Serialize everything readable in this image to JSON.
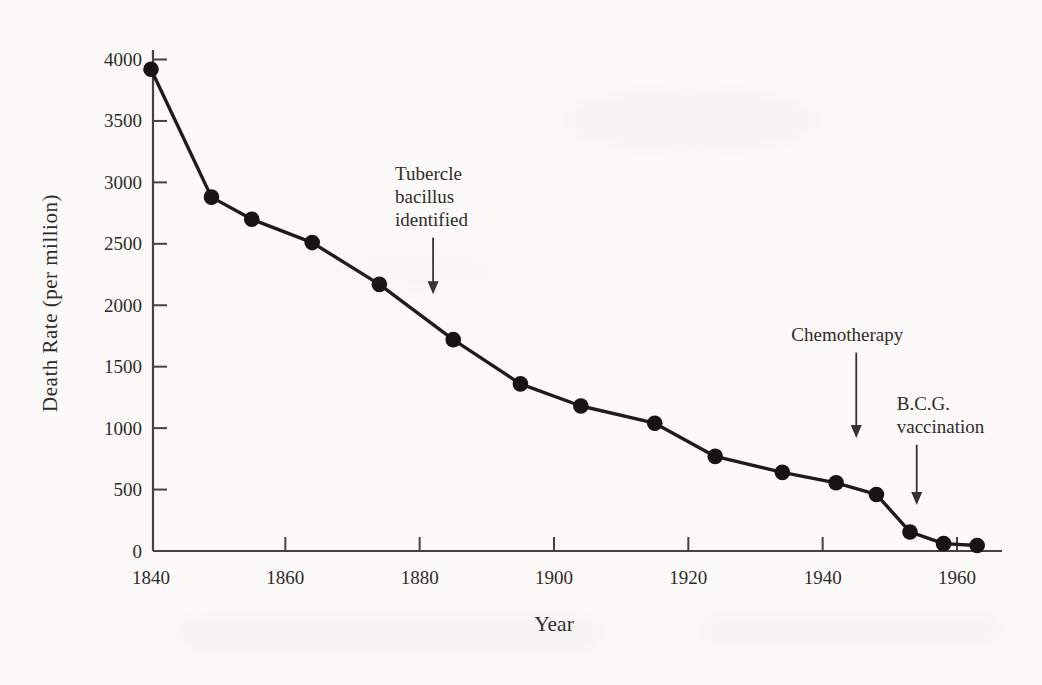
{
  "page": {
    "background": "#fbfaf8"
  },
  "chart_data": {
    "type": "line",
    "title": "",
    "xlabel": "Year",
    "ylabel": "Death Rate (per million)",
    "xlim": [
      1840,
      1966
    ],
    "ylim": [
      0,
      4000
    ],
    "grid": false,
    "legend": "none",
    "marker": "filled-circle",
    "line_color": "#1d1c1a",
    "marker_color": "#161513",
    "axis_color": "#45423e",
    "text_color": "#2e2c29",
    "x_ticks": [
      1840,
      1860,
      1880,
      1900,
      1920,
      1940,
      1960
    ],
    "y_ticks": [
      0,
      500,
      1000,
      1500,
      2000,
      2500,
      3000,
      3500,
      4000
    ],
    "series": [
      {
        "name": "Tuberculosis death rate",
        "x": [
          1840,
          1849,
          1855,
          1864,
          1874,
          1885,
          1895,
          1904,
          1915,
          1924,
          1934,
          1942,
          1948,
          1953,
          1958,
          1963
        ],
        "y": [
          3920,
          2880,
          2700,
          2510,
          2170,
          1720,
          1360,
          1180,
          1040,
          770,
          640,
          555,
          460,
          155,
          60,
          45
        ]
      }
    ],
    "annotations": [
      {
        "id": "tubercle-bacillus-identified",
        "lines": [
          "Tubercle",
          "bacillus",
          "identified"
        ],
        "year": 1882,
        "value_tail": 2550,
        "value_tip": 2090,
        "align": "left",
        "text_dx": -38
      },
      {
        "id": "chemotherapy",
        "lines": [
          "Chemotherapy"
        ],
        "year": 1945,
        "value_tail": 1615,
        "value_tip": 920,
        "align": "center",
        "text_dx": -9
      },
      {
        "id": "bcg-vaccination",
        "lines": [
          "B.C.G.",
          "vaccination"
        ],
        "year": 1954,
        "value_tail": 865,
        "value_tip": 375,
        "align": "left",
        "text_dx": -20
      }
    ]
  }
}
